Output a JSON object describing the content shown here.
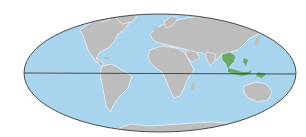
{
  "map": {
    "projection": "mollweide",
    "colors": {
      "ocean": "#a9d4ee",
      "land": "#bdbdbd",
      "land_shadow": "#8a8a8a",
      "coast_highlight": "#ffffff",
      "highlight_region": "#6aa86a",
      "outline": "#3a3a3a",
      "equator": "#2a2a2a",
      "background": "#ffffff"
    },
    "highlighted_regions": [
      "Southeast Asia (Indochina)",
      "Malay Archipelago"
    ],
    "lines": [
      "equator"
    ]
  }
}
